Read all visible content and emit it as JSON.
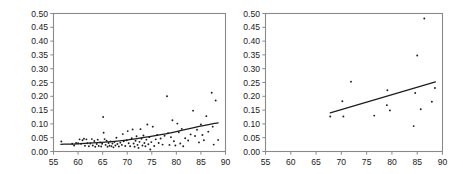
{
  "figure": {
    "background": "#ffffff",
    "point_color": "#1c1c1c",
    "line_color": "#1c1c1c",
    "frame_color": "#8a8a8a",
    "panel_count": 2
  },
  "chart_data": [
    {
      "type": "scatter",
      "panel": "left",
      "title": "",
      "subtitle": "",
      "xlabel": "",
      "ylabel": "",
      "xlim": [
        55,
        90
      ],
      "ylim": [
        0.0,
        0.5
      ],
      "xticks": [
        55,
        60,
        65,
        70,
        75,
        80,
        85,
        90
      ],
      "xticklabels": [
        "55",
        "60",
        "65",
        "70",
        "75",
        "80",
        "85",
        "90"
      ],
      "yticks": [
        0.0,
        0.05,
        0.1,
        0.15,
        0.2,
        0.25,
        0.3,
        0.35,
        0.4,
        0.45,
        0.5
      ],
      "yticklabels": [
        "0.00",
        "0.05",
        "0.10",
        "0.15",
        "0.20",
        "0.25",
        "0.30",
        "0.35",
        "0.40",
        "0.45",
        "0.50"
      ],
      "grid": false,
      "legend": null,
      "marker": "dot",
      "points": [
        [
          56.6,
          0.036
        ],
        [
          58.8,
          0.028
        ],
        [
          59.2,
          0.022
        ],
        [
          59.6,
          0.031
        ],
        [
          60.0,
          0.03
        ],
        [
          60.3,
          0.044
        ],
        [
          60.6,
          0.028
        ],
        [
          60.9,
          0.041
        ],
        [
          61.2,
          0.046
        ],
        [
          61.4,
          0.021
        ],
        [
          61.7,
          0.044
        ],
        [
          61.9,
          0.03
        ],
        [
          62.2,
          0.019
        ],
        [
          62.5,
          0.029
        ],
        [
          62.8,
          0.045
        ],
        [
          63.0,
          0.022
        ],
        [
          63.3,
          0.038
        ],
        [
          63.5,
          0.017
        ],
        [
          63.8,
          0.027
        ],
        [
          64.0,
          0.043
        ],
        [
          64.2,
          0.02
        ],
        [
          64.5,
          0.033
        ],
        [
          64.7,
          0.018
        ],
        [
          64.9,
          0.028
        ],
        [
          65.1,
          0.125
        ],
        [
          65.2,
          0.068
        ],
        [
          65.4,
          0.045
        ],
        [
          65.6,
          0.024
        ],
        [
          65.8,
          0.039
        ],
        [
          66.0,
          0.017
        ],
        [
          66.2,
          0.031
        ],
        [
          66.4,
          0.021
        ],
        [
          66.6,
          0.036
        ],
        [
          66.8,
          0.019
        ],
        [
          67.0,
          0.029
        ],
        [
          67.2,
          0.015
        ],
        [
          67.4,
          0.034
        ],
        [
          67.6,
          0.022
        ],
        [
          67.8,
          0.05
        ],
        [
          68.0,
          0.027
        ],
        [
          68.3,
          0.018
        ],
        [
          68.6,
          0.032
        ],
        [
          68.9,
          0.024
        ],
        [
          69.1,
          0.063
        ],
        [
          69.3,
          0.037
        ],
        [
          69.6,
          0.02
        ],
        [
          69.9,
          0.041
        ],
        [
          70.1,
          0.074
        ],
        [
          70.3,
          0.03
        ],
        [
          70.6,
          0.019
        ],
        [
          70.9,
          0.048
        ],
        [
          71.1,
          0.08
        ],
        [
          71.3,
          0.029
        ],
        [
          71.5,
          0.017
        ],
        [
          71.7,
          0.039
        ],
        [
          71.9,
          0.055
        ],
        [
          72.1,
          0.024
        ],
        [
          72.3,
          0.013
        ],
        [
          72.5,
          0.035
        ],
        [
          72.7,
          0.081
        ],
        [
          72.9,
          0.046
        ],
        [
          73.1,
          0.022
        ],
        [
          73.3,
          0.058
        ],
        [
          73.5,
          0.031
        ],
        [
          73.7,
          0.019
        ],
        [
          73.9,
          0.043
        ],
        [
          74.1,
          0.098
        ],
        [
          74.3,
          0.026
        ],
        [
          74.5,
          0.052
        ],
        [
          74.7,
          0.007
        ],
        [
          74.9,
          0.034
        ],
        [
          75.2,
          0.09
        ],
        [
          75.5,
          0.02
        ],
        [
          75.8,
          0.044
        ],
        [
          76.1,
          0.06
        ],
        [
          76.4,
          0.031
        ],
        [
          76.8,
          0.047
        ],
        [
          77.2,
          0.025
        ],
        [
          77.6,
          0.057
        ],
        [
          78.1,
          0.2
        ],
        [
          78.3,
          0.066
        ],
        [
          78.6,
          0.024
        ],
        [
          78.9,
          0.052
        ],
        [
          79.2,
          0.113
        ],
        [
          79.5,
          0.037
        ],
        [
          79.8,
          0.022
        ],
        [
          80.2,
          0.101
        ],
        [
          80.5,
          0.07
        ],
        [
          80.8,
          0.029
        ],
        [
          81.1,
          0.082
        ],
        [
          81.4,
          0.019
        ],
        [
          81.8,
          0.048
        ],
        [
          82.4,
          0.04
        ],
        [
          82.9,
          0.062
        ],
        [
          83.4,
          0.148
        ],
        [
          83.8,
          0.056
        ],
        [
          84.2,
          0.079
        ],
        [
          84.6,
          0.033
        ],
        [
          85.0,
          0.098
        ],
        [
          85.3,
          0.06
        ],
        [
          85.6,
          0.041
        ],
        [
          86.1,
          0.128
        ],
        [
          86.5,
          0.072
        ],
        [
          87.2,
          0.213
        ],
        [
          87.4,
          0.09
        ],
        [
          87.6,
          0.025
        ],
        [
          88.0,
          0.185
        ],
        [
          88.5,
          0.042
        ]
      ],
      "trend": {
        "kind": "curve",
        "points": [
          [
            56.5,
            0.026
          ],
          [
            60,
            0.028
          ],
          [
            64,
            0.032
          ],
          [
            68,
            0.038
          ],
          [
            72,
            0.047
          ],
          [
            76,
            0.058
          ],
          [
            80,
            0.072
          ],
          [
            84,
            0.088
          ],
          [
            88.5,
            0.104
          ]
        ]
      }
    },
    {
      "type": "scatter",
      "panel": "right",
      "title": "",
      "subtitle": "",
      "xlabel": "",
      "ylabel": "",
      "xlim": [
        55,
        90
      ],
      "ylim": [
        0.0,
        0.5
      ],
      "xticks": [
        55,
        60,
        65,
        70,
        75,
        80,
        85,
        90
      ],
      "xticklabels": [
        "55",
        "60",
        "65",
        "70",
        "75",
        "80",
        "85",
        "90"
      ],
      "yticks": [
        0.0,
        0.05,
        0.1,
        0.15,
        0.2,
        0.25,
        0.3,
        0.35,
        0.4,
        0.45,
        0.5
      ],
      "yticklabels": [
        "0.00",
        "0.05",
        "0.10",
        "0.15",
        "0.20",
        "0.25",
        "0.30",
        "0.35",
        "0.40",
        "0.45",
        "0.50"
      ],
      "grid": false,
      "legend": null,
      "marker": "dot",
      "points": [
        [
          67.8,
          0.127
        ],
        [
          70.2,
          0.182
        ],
        [
          70.4,
          0.127
        ],
        [
          71.9,
          0.253
        ],
        [
          76.5,
          0.13
        ],
        [
          79.0,
          0.168
        ],
        [
          79.1,
          0.222
        ],
        [
          79.6,
          0.149
        ],
        [
          84.3,
          0.092
        ],
        [
          84.6,
          0.212
        ],
        [
          85.0,
          0.348
        ],
        [
          85.7,
          0.153
        ],
        [
          86.4,
          0.482
        ],
        [
          87.9,
          0.18
        ],
        [
          88.5,
          0.23
        ]
      ],
      "trend": {
        "kind": "line",
        "points": [
          [
            67.8,
            0.14
          ],
          [
            88.6,
            0.252
          ]
        ]
      }
    }
  ]
}
